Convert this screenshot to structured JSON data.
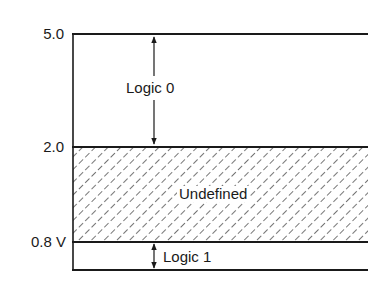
{
  "diagram": {
    "title": "",
    "colors": {
      "line": "#1a1a1a",
      "background": "#ffffff",
      "hatch": "#2a2a2a"
    },
    "levels": [
      {
        "id": "v5",
        "label": "5.0",
        "y": 34
      },
      {
        "id": "v2",
        "label": "2.0",
        "y": 147
      },
      {
        "id": "v08",
        "label": "0.8 V",
        "y": 242
      },
      {
        "id": "v0",
        "label": "",
        "y": 270
      }
    ],
    "regions": [
      {
        "id": "logic0",
        "label": "Logic 0",
        "from": "5.0",
        "to": "2.0",
        "hatched": false,
        "arrow": "double"
      },
      {
        "id": "undefined",
        "label": "Undefined",
        "from": "2.0",
        "to": "0.8",
        "hatched": true,
        "arrow": "none"
      },
      {
        "id": "logic1",
        "label": "Logic 1",
        "from": "0.8",
        "to": "0",
        "hatched": false,
        "arrow": "double"
      }
    ]
  }
}
